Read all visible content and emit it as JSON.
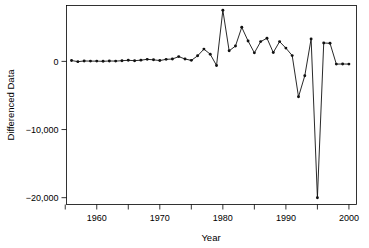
{
  "chart_data": {
    "type": "line",
    "title": "",
    "subtitle": "",
    "xlabel": "Year",
    "ylabel": "Differenced Data",
    "xlim": [
      1955.2,
      2001.2
    ],
    "ylim": [
      -21000,
      8200
    ],
    "grid": false,
    "legend": null,
    "marker": "filled-circle",
    "x_ticks_major": [
      1960,
      1970,
      1980,
      1990,
      2000
    ],
    "x_ticks_minor": [
      1955,
      1965,
      1975,
      1985,
      1995
    ],
    "x_tick_labels": [
      "1960",
      "1970",
      "1980",
      "1990",
      "2000"
    ],
    "y_ticks": [
      0,
      -10000,
      -20000
    ],
    "y_tick_labels": [
      "0",
      "-10,000",
      "-20,000"
    ],
    "series": [
      {
        "name": "Differenced Data",
        "color": "#111111",
        "x": [
          1956,
          1957,
          1958,
          1959,
          1960,
          1961,
          1962,
          1963,
          1964,
          1965,
          1966,
          1967,
          1968,
          1969,
          1970,
          1971,
          1972,
          1973,
          1974,
          1975,
          1976,
          1977,
          1978,
          1979,
          1980,
          1981,
          1982,
          1983,
          1984,
          1985,
          1986,
          1987,
          1988,
          1989,
          1990,
          1991,
          1992,
          1993,
          1994,
          1995,
          1996,
          1997,
          1998,
          1999,
          2000
        ],
        "values": [
          130,
          -40,
          60,
          40,
          40,
          10,
          60,
          40,
          100,
          160,
          100,
          180,
          300,
          230,
          120,
          300,
          350,
          700,
          350,
          150,
          820,
          1800,
          1050,
          -600,
          7500,
          1550,
          2250,
          5000,
          3000,
          1250,
          2900,
          3400,
          1300,
          2900,
          1950,
          850,
          -5200,
          -2100,
          3300,
          -20000,
          2700,
          2650,
          -400,
          -380,
          -400
        ]
      }
    ]
  },
  "axes": {
    "y_axis_title": "Differenced Data",
    "x_axis_title": "Year"
  }
}
